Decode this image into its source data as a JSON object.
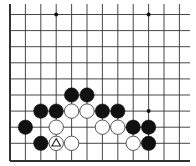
{
  "diagram": {
    "type": "go-board-fragment",
    "grid": {
      "columns_x": [
        10,
        25.4,
        40.8,
        56.2,
        71.6,
        87,
        102.4,
        117.8,
        133.2,
        148.6,
        164,
        179.4
      ],
      "rows_y": [
        14.5,
        30.6,
        46.7,
        62.8,
        78.9,
        95,
        111.1,
        127.2,
        143.3,
        161
      ],
      "right_extent": 190,
      "top_extent": 4,
      "left_edge_thick": true,
      "bottom_edge_thick": true,
      "line_color": "#333333"
    },
    "star_points": [
      {
        "col": 3,
        "row": 0
      },
      {
        "col": 9,
        "row": 0
      },
      {
        "col": 9,
        "row": 6
      }
    ],
    "stones": [
      {
        "color": "black",
        "col": 4,
        "row": 5
      },
      {
        "color": "black",
        "col": 5,
        "row": 5
      },
      {
        "color": "black",
        "col": 2,
        "row": 6
      },
      {
        "color": "black",
        "col": 3,
        "row": 6
      },
      {
        "color": "white",
        "col": 4,
        "row": 6
      },
      {
        "color": "white",
        "col": 5,
        "row": 6
      },
      {
        "color": "black",
        "col": 6,
        "row": 6
      },
      {
        "color": "black",
        "col": 7,
        "row": 6
      },
      {
        "color": "black",
        "col": 1,
        "row": 7
      },
      {
        "color": "white",
        "col": 3,
        "row": 7
      },
      {
        "color": "white",
        "col": 6,
        "row": 7
      },
      {
        "color": "white",
        "col": 7,
        "row": 7
      },
      {
        "color": "black",
        "col": 8,
        "row": 7
      },
      {
        "color": "black",
        "col": 9,
        "row": 7
      },
      {
        "color": "black",
        "col": 2,
        "row": 8
      },
      {
        "color": "white",
        "col": 3,
        "row": 8,
        "marker": "triangle"
      },
      {
        "color": "white",
        "col": 4,
        "row": 8
      },
      {
        "color": "white",
        "col": 8,
        "row": 8
      },
      {
        "color": "black",
        "col": 9,
        "row": 8
      }
    ],
    "colors": {
      "black_stone": "#111111",
      "white_stone": "#ffffff",
      "white_stone_outline": "#444444",
      "marker": "#222222"
    }
  }
}
